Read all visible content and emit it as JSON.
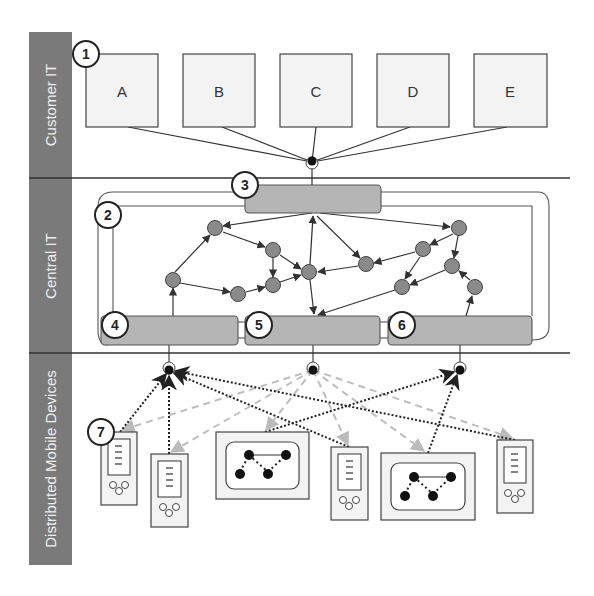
{
  "lanes": [
    {
      "label": "Customer IT"
    },
    {
      "label": "Central IT"
    },
    {
      "label": "Distributed Mobile Devices"
    }
  ],
  "customer_systems": [
    {
      "label": "A"
    },
    {
      "label": "B"
    },
    {
      "label": "C"
    },
    {
      "label": "D"
    },
    {
      "label": "E"
    }
  ],
  "callouts": [
    {
      "number": "1"
    },
    {
      "number": "2"
    },
    {
      "number": "3"
    },
    {
      "number": "4"
    },
    {
      "number": "5"
    },
    {
      "number": "6"
    },
    {
      "number": "7"
    }
  ],
  "colors": {
    "lane_bar": "#7a7a7a",
    "box_fill": "#f3f3f3",
    "gateway_fill": "#b5b5b5",
    "node_fill": "#8a8a8a",
    "dotted_link": "#333333",
    "dashed_link": "#bdbdbd"
  }
}
